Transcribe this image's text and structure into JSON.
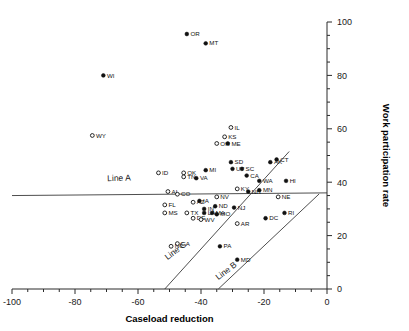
{
  "chart_data": {
    "type": "scatter",
    "title": "",
    "xlabel": "Caseload reduction",
    "ylabel": "Work participation rate",
    "xlim": [
      -100,
      0
    ],
    "ylim": [
      0,
      100
    ],
    "xticks": [
      -100,
      -80,
      -60,
      -40,
      -20,
      0
    ],
    "yticks": [
      0,
      20,
      40,
      60,
      80,
      100
    ],
    "xtick_labels": [
      "-100",
      "-80",
      "-60",
      "-40",
      "-20",
      "0"
    ],
    "ytick_labels": [
      "0",
      "20",
      "40",
      "60",
      "80",
      "100"
    ],
    "minor_tick_step": 5,
    "grid": false,
    "legend": "none",
    "x_axis_position": "bottom",
    "y_axis_position": "right",
    "marker_types": [
      "filled",
      "open"
    ],
    "annotations": [
      {
        "name": "Line A",
        "label": "Line A",
        "x": -66,
        "y": 40.5,
        "rotation": -2,
        "line": {
          "x1": -100,
          "y1": 35.0,
          "x2": 0,
          "y2": 36.0
        }
      },
      {
        "name": "Line B",
        "label": "Line B",
        "x": -31.5,
        "y": 6.0,
        "rotation": -37,
        "line": {
          "x1": -34.5,
          "y1": 0,
          "x2": -2.5,
          "y2": 35.6
        }
      },
      {
        "name": "Line C",
        "label": "Line C",
        "x": -47.5,
        "y": 13.5,
        "rotation": -37,
        "line": {
          "x1": -51.5,
          "y1": 0,
          "x2": -12.0,
          "y2": 51.5
        }
      }
    ],
    "points": [
      {
        "state": "OR",
        "x": -44.5,
        "y": 95.5,
        "marker": "filled",
        "label_pos": "right"
      },
      {
        "state": "MT",
        "x": -38.5,
        "y": 92.0,
        "marker": "filled",
        "label_pos": "right"
      },
      {
        "state": "WI",
        "x": -71.0,
        "y": 80.0,
        "marker": "filled",
        "label_pos": "right"
      },
      {
        "state": "WY",
        "x": -74.5,
        "y": 57.5,
        "marker": "open",
        "label_pos": "right"
      },
      {
        "state": "IL",
        "x": -30.5,
        "y": 60.5,
        "marker": "open",
        "label_pos": "right"
      },
      {
        "state": "KS",
        "x": -32.5,
        "y": 57.0,
        "marker": "open",
        "label_pos": "right"
      },
      {
        "state": "OH",
        "x": -35.0,
        "y": 54.5,
        "marker": "open",
        "label_pos": "right"
      },
      {
        "state": "ME",
        "x": -31.5,
        "y": 54.5,
        "marker": "filled",
        "label_pos": "right"
      },
      {
        "state": "SD",
        "x": -30.5,
        "y": 47.5,
        "marker": "filled",
        "label_pos": "right"
      },
      {
        "state": "AK",
        "x": -18.0,
        "y": 47.5,
        "marker": "filled",
        "label_pos": "right"
      },
      {
        "state": "CT",
        "x": -16.0,
        "y": 48.5,
        "marker": "filled",
        "label_pos": "right"
      },
      {
        "state": "UT",
        "x": -30.0,
        "y": 45.0,
        "marker": "filled",
        "label_pos": "right"
      },
      {
        "state": "SC",
        "x": -27.0,
        "y": 45.0,
        "marker": "filled",
        "label_pos": "right"
      },
      {
        "state": "MI",
        "x": -38.5,
        "y": 44.5,
        "marker": "filled",
        "label_pos": "right"
      },
      {
        "state": "ID",
        "x": -53.5,
        "y": 43.5,
        "marker": "open",
        "label_pos": "right"
      },
      {
        "state": "OK",
        "x": -45.5,
        "y": 43.5,
        "marker": "open",
        "label_pos": "right"
      },
      {
        "state": "TN",
        "x": -45.5,
        "y": 42.0,
        "marker": "open",
        "label_pos": "right"
      },
      {
        "state": "VA",
        "x": -41.5,
        "y": 41.5,
        "marker": "filled",
        "label_pos": "right"
      },
      {
        "state": "CA",
        "x": -25.5,
        "y": 42.5,
        "marker": "filled",
        "label_pos": "right"
      },
      {
        "state": "WA",
        "x": -21.5,
        "y": 40.5,
        "marker": "filled",
        "label_pos": "right"
      },
      {
        "state": "HI",
        "x": -13.0,
        "y": 40.5,
        "marker": "filled",
        "label_pos": "right"
      },
      {
        "state": "KY",
        "x": -28.5,
        "y": 37.5,
        "marker": "open",
        "label_pos": "right"
      },
      {
        "state": "NH",
        "x": -25.0,
        "y": 36.5,
        "marker": "filled",
        "label_pos": "right"
      },
      {
        "state": "MN",
        "x": -21.5,
        "y": 37.0,
        "marker": "filled",
        "label_pos": "right"
      },
      {
        "state": "AL",
        "x": -50.5,
        "y": 36.5,
        "marker": "open",
        "label_pos": "right"
      },
      {
        "state": "CO",
        "x": -47.5,
        "y": 35.5,
        "marker": "open",
        "label_pos": "right"
      },
      {
        "state": "NE",
        "x": -15.5,
        "y": 34.5,
        "marker": "open",
        "label_pos": "right"
      },
      {
        "state": "NV",
        "x": -35.0,
        "y": 34.5,
        "marker": "open",
        "label_pos": "right"
      },
      {
        "state": "IA",
        "x": -40.5,
        "y": 33.0,
        "marker": "filled",
        "label_pos": "right"
      },
      {
        "state": "AZ",
        "x": -42.5,
        "y": 32.5,
        "marker": "open",
        "label_pos": "right"
      },
      {
        "state": "FL",
        "x": -51.5,
        "y": 31.5,
        "marker": "open",
        "label_pos": "right"
      },
      {
        "state": "ND",
        "x": -35.5,
        "y": 31.0,
        "marker": "filled",
        "label_pos": "right"
      },
      {
        "state": "NJ",
        "x": -29.5,
        "y": 30.5,
        "marker": "filled",
        "label_pos": "right"
      },
      {
        "state": "IN",
        "x": -39.0,
        "y": 30.0,
        "marker": "filled",
        "label_pos": "right"
      },
      {
        "state": "MS",
        "x": -51.5,
        "y": 28.5,
        "marker": "open",
        "label_pos": "right"
      },
      {
        "state": "TX",
        "x": -44.5,
        "y": 28.5,
        "marker": "open",
        "label_pos": "right"
      },
      {
        "state": "LA",
        "x": -39.0,
        "y": 28.5,
        "marker": "filled",
        "label_pos": "right"
      },
      {
        "state": "MA",
        "x": -36.5,
        "y": 28.5,
        "marker": "filled",
        "label_pos": "right"
      },
      {
        "state": "MO",
        "x": -35.0,
        "y": 28.0,
        "marker": "filled",
        "label_pos": "right"
      },
      {
        "state": "RI",
        "x": -13.5,
        "y": 28.5,
        "marker": "filled",
        "label_pos": "right"
      },
      {
        "state": "DE",
        "x": -42.5,
        "y": 26.5,
        "marker": "open",
        "label_pos": "right"
      },
      {
        "state": "WV",
        "x": -40.0,
        "y": 26.0,
        "marker": "open",
        "label_pos": "right"
      },
      {
        "state": "DC",
        "x": -19.5,
        "y": 26.5,
        "marker": "filled",
        "label_pos": "right"
      },
      {
        "state": "AR",
        "x": -28.5,
        "y": 24.5,
        "marker": "open",
        "label_pos": "right"
      },
      {
        "state": "NC",
        "x": -49.5,
        "y": 16.0,
        "marker": "open",
        "label_pos": "right"
      },
      {
        "state": "GA",
        "x": -47.5,
        "y": 17.0,
        "marker": "open",
        "label_pos": "right"
      },
      {
        "state": "PA",
        "x": -34.0,
        "y": 16.0,
        "marker": "filled",
        "label_pos": "right"
      },
      {
        "state": "MD",
        "x": -28.5,
        "y": 11.0,
        "marker": "filled",
        "label_pos": "right"
      }
    ]
  },
  "axes": {
    "x_title": "Caseload reduction",
    "y_title": "Work participation rate"
  },
  "colors": {
    "axis": "#2b2b2b",
    "marker_fill": "#111111",
    "marker_open_fill": "#ffffff",
    "line": "#3a3a3a",
    "background": "#ffffff"
  }
}
